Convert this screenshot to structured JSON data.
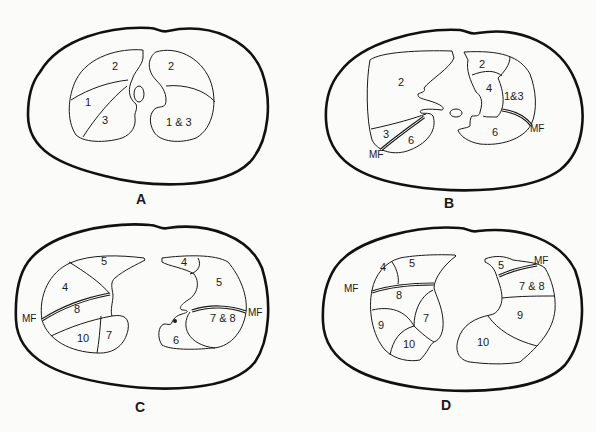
{
  "figure": {
    "panels": [
      {
        "id": "A",
        "label": "A",
        "left_lung_segments": [
          "2",
          "1",
          "3"
        ],
        "right_lung_segments": [
          "2",
          "1 & 3"
        ]
      },
      {
        "id": "B",
        "label": "B",
        "left_lung_segments": [
          "2",
          "3",
          "6"
        ],
        "left_fissure_label": "MF",
        "right_lung_segments": [
          "2",
          "4",
          "1&3",
          "6"
        ],
        "right_fissure_label": "MF"
      },
      {
        "id": "C",
        "label": "C",
        "left_lung_segments": [
          "5",
          "4",
          "8",
          "10",
          "7"
        ],
        "left_fissure_label": "MF",
        "right_lung_segments": [
          "4",
          "5",
          "7 & 8",
          "6"
        ],
        "right_fissure_label": "MF"
      },
      {
        "id": "D",
        "label": "D",
        "left_lung_segments": [
          "4",
          "5",
          "8",
          "9",
          "7",
          "10"
        ],
        "left_fissure_label": "MF",
        "right_lung_segments": [
          "5",
          "7 & 8",
          "9",
          "10"
        ],
        "right_fissure_label": "MF"
      }
    ]
  },
  "legend": {
    "MF": "MF"
  }
}
